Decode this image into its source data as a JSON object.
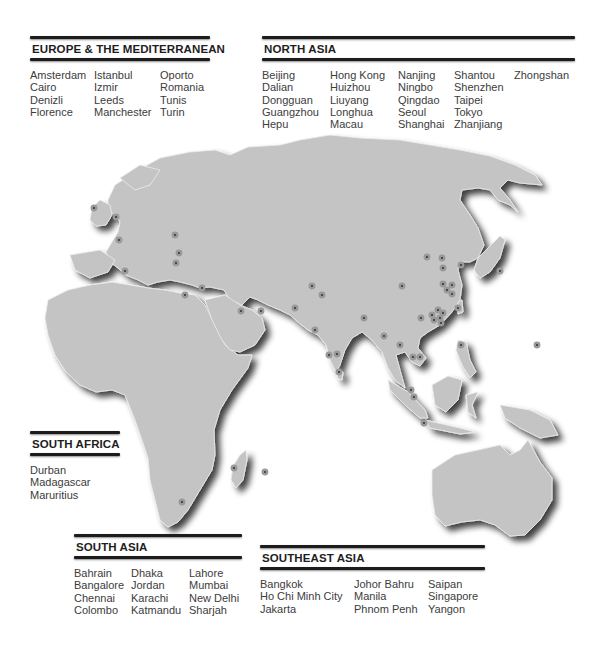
{
  "regions": {
    "europe": {
      "title": "EUROPE & THE MEDITERRANEAN",
      "columns": [
        [
          "Amsterdam",
          "Cairo",
          "Denizli",
          "Florence"
        ],
        [
          "Istanbul",
          "Izmir",
          "Leeds",
          "Manchester"
        ],
        [
          "Oporto",
          "Romania",
          "Tunis",
          "Turin"
        ]
      ]
    },
    "north_asia": {
      "title": "NORTH ASIA",
      "columns": [
        [
          "Beijing",
          "Dalian",
          "Dongguan",
          "Guangzhou",
          "Hepu"
        ],
        [
          "Hong Kong",
          "Huizhou",
          "Liuyang",
          "Longhua",
          "Macau"
        ],
        [
          "Nanjing",
          "Ningbo",
          "Qingdao",
          "Seoul",
          "Shanghai"
        ],
        [
          "Shantou",
          "Shenzhen",
          "Taipei",
          "Tokyo",
          "Zhanjiang"
        ],
        [
          "Zhongshan"
        ]
      ]
    },
    "south_africa": {
      "title": "SOUTH AFRICA",
      "columns": [
        [
          "Durban",
          "Madagascar",
          "Maruritius"
        ]
      ]
    },
    "south_asia": {
      "title": "SOUTH ASIA",
      "columns": [
        [
          "Bahrain",
          "Bangalore",
          "Chennai",
          "Colombo"
        ],
        [
          "Dhaka",
          "Jordan",
          "Karachi",
          "Katmandu"
        ],
        [
          "Lahore",
          "Mumbai",
          "New Delhi",
          "Sharjah"
        ]
      ]
    },
    "southeast_asia": {
      "title": "SOUTHEAST ASIA",
      "columns": [
        [
          "Bangkok",
          "Ho Chi Minh City",
          "Jakarta"
        ],
        [
          "Johor Bahru",
          "Manila",
          "Phnom Penh"
        ],
        [
          "Saipan",
          "Singapore",
          "Yangon"
        ]
      ]
    }
  },
  "colors": {
    "land": "#c4c4c4",
    "rule": "#1c1c1c",
    "dot": "#2a2a2a",
    "text": "#3c3c3c"
  }
}
